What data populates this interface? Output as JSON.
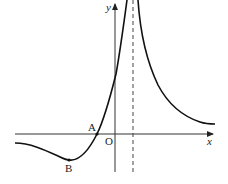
{
  "diagram": {
    "type": "function-graph",
    "axes": {
      "x_label": "x",
      "y_label": "y",
      "origin_label": "O"
    },
    "points": [
      {
        "label": "A",
        "description": "x-intercept of left branch"
      },
      {
        "label": "B",
        "description": "local minimum of left branch"
      }
    ],
    "asymptote": {
      "style": "dashed",
      "orientation": "vertical",
      "position": "right of y-axis"
    },
    "colors": {
      "stroke": "#222222",
      "background": "#ffffff"
    }
  }
}
